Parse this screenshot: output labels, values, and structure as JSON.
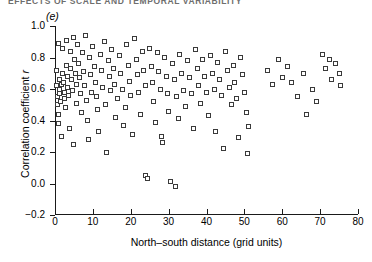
{
  "figure": {
    "running_head": "EFFECTS OF SCALE AND TEMPORAL VARIABILITY",
    "panel_label": "(e)"
  },
  "chart_data": {
    "type": "scatter",
    "title": "",
    "subtitle": "",
    "panel": "(e)",
    "xlabel": "North–south distance (grid units)",
    "ylabel": "Correlation coefficient r",
    "xlim": [
      0,
      80
    ],
    "ylim": [
      -0.2,
      1.0
    ],
    "xticks": [
      0,
      10,
      20,
      30,
      40,
      50,
      60,
      70,
      80
    ],
    "xticklabels": [
      "0",
      "10",
      "20",
      "30",
      "40",
      "50",
      "60",
      "70",
      "80"
    ],
    "yticks": [
      -0.2,
      0.0,
      0.2,
      0.4,
      0.6,
      0.8,
      1.0
    ],
    "yticklabels": [
      "−0.2",
      "0.0",
      "0.2",
      "0.4",
      "0.6",
      "0.8",
      "1.0"
    ],
    "grid": false,
    "legend": null,
    "marker": "open-square",
    "marker_color": "#3a3a3a",
    "marker_fill": "#ffffff",
    "points": [
      [
        0.4,
        0.72
      ],
      [
        0.5,
        0.62
      ],
      [
        0.6,
        0.55
      ],
      [
        0.7,
        0.5
      ],
      [
        0.8,
        0.44
      ],
      [
        0.9,
        0.38
      ],
      [
        1.0,
        0.89
      ],
      [
        1.1,
        0.66
      ],
      [
        1.2,
        0.6
      ],
      [
        1.3,
        0.57
      ],
      [
        1.5,
        0.52
      ],
      [
        1.6,
        0.63
      ],
      [
        1.8,
        0.3
      ],
      [
        2.0,
        0.86
      ],
      [
        2.1,
        0.7
      ],
      [
        2.3,
        0.64
      ],
      [
        2.5,
        0.58
      ],
      [
        2.6,
        0.54
      ],
      [
        2.8,
        0.48
      ],
      [
        3.0,
        0.91
      ],
      [
        3.1,
        0.75
      ],
      [
        3.3,
        0.68
      ],
      [
        3.4,
        0.61
      ],
      [
        3.6,
        0.56
      ],
      [
        3.8,
        0.35
      ],
      [
        4.0,
        0.84
      ],
      [
        4.2,
        0.73
      ],
      [
        4.4,
        0.66
      ],
      [
        4.6,
        0.59
      ],
      [
        4.8,
        0.25
      ],
      [
        5.0,
        0.93
      ],
      [
        5.2,
        0.79
      ],
      [
        5.4,
        0.7
      ],
      [
        5.6,
        0.63
      ],
      [
        5.8,
        0.51
      ],
      [
        6.0,
        0.88
      ],
      [
        6.3,
        0.76
      ],
      [
        6.5,
        0.67
      ],
      [
        6.8,
        0.57
      ],
      [
        7.0,
        0.45
      ],
      [
        7.2,
        0.83
      ],
      [
        7.5,
        0.71
      ],
      [
        7.8,
        0.62
      ],
      [
        8.0,
        0.94
      ],
      [
        8.2,
        0.53
      ],
      [
        8.5,
        0.4
      ],
      [
        8.8,
        0.28
      ],
      [
        9.0,
        0.8
      ],
      [
        9.3,
        0.69
      ],
      [
        9.6,
        0.58
      ],
      [
        10.0,
        0.87
      ],
      [
        10.3,
        0.74
      ],
      [
        10.6,
        0.64
      ],
      [
        11.0,
        0.55
      ],
      [
        11.3,
        0.47
      ],
      [
        11.6,
        0.33
      ],
      [
        12.0,
        0.82
      ],
      [
        12.3,
        0.72
      ],
      [
        12.6,
        0.61
      ],
      [
        13.0,
        0.9
      ],
      [
        13.3,
        0.5
      ],
      [
        13.6,
        0.2
      ],
      [
        14.0,
        0.78
      ],
      [
        14.3,
        0.68
      ],
      [
        14.6,
        0.59
      ],
      [
        15.0,
        0.85
      ],
      [
        15.4,
        0.73
      ],
      [
        15.8,
        0.63
      ],
      [
        16.0,
        0.42
      ],
      [
        16.5,
        0.54
      ],
      [
        17.0,
        0.81
      ],
      [
        17.4,
        0.7
      ],
      [
        17.8,
        0.6
      ],
      [
        18.0,
        0.37
      ],
      [
        18.5,
        0.48
      ],
      [
        19.0,
        0.88
      ],
      [
        19.4,
        0.75
      ],
      [
        19.8,
        0.65
      ],
      [
        20.0,
        0.56
      ],
      [
        20.5,
        0.31
      ],
      [
        21.0,
        0.92
      ],
      [
        21.4,
        0.79
      ],
      [
        21.8,
        0.69
      ],
      [
        22.0,
        0.58
      ],
      [
        22.5,
        0.44
      ],
      [
        23.0,
        0.84
      ],
      [
        23.4,
        0.72
      ],
      [
        23.8,
        0.62
      ],
      [
        24.0,
        0.05
      ],
      [
        24.3,
        0.03
      ],
      [
        25.0,
        0.86
      ],
      [
        25.4,
        0.74
      ],
      [
        25.8,
        0.64
      ],
      [
        26.0,
        0.52
      ],
      [
        26.5,
        0.39
      ],
      [
        27.0,
        0.83
      ],
      [
        27.4,
        0.71
      ],
      [
        27.8,
        0.6
      ],
      [
        28.0,
        0.3
      ],
      [
        28.3,
        0.26
      ],
      [
        29.0,
        0.8
      ],
      [
        29.4,
        0.68
      ],
      [
        29.8,
        0.57
      ],
      [
        30.0,
        0.46
      ],
      [
        30.6,
        0.01
      ],
      [
        31.0,
        0.76
      ],
      [
        31.5,
        0.66
      ],
      [
        31.8,
        -0.02
      ],
      [
        32.0,
        0.55
      ],
      [
        32.5,
        0.41
      ],
      [
        33.0,
        0.82
      ],
      [
        33.5,
        0.7
      ],
      [
        34.0,
        0.59
      ],
      [
        34.5,
        0.49
      ],
      [
        35.0,
        0.78
      ],
      [
        35.5,
        0.67
      ],
      [
        36.0,
        0.57
      ],
      [
        36.5,
        0.35
      ],
      [
        37.0,
        0.85
      ],
      [
        37.5,
        0.73
      ],
      [
        38.0,
        0.62
      ],
      [
        38.5,
        0.51
      ],
      [
        39.0,
        0.79
      ],
      [
        39.5,
        0.68
      ],
      [
        40.0,
        0.58
      ],
      [
        40.5,
        0.43
      ],
      [
        41.0,
        0.81
      ],
      [
        41.5,
        0.7
      ],
      [
        42.0,
        0.6
      ],
      [
        42.5,
        0.33
      ],
      [
        43.0,
        0.77
      ],
      [
        43.5,
        0.66
      ],
      [
        44.0,
        0.56
      ],
      [
        44.5,
        0.22
      ],
      [
        45.0,
        0.84
      ],
      [
        45.5,
        0.72
      ],
      [
        46.0,
        0.61
      ],
      [
        46.5,
        0.5
      ],
      [
        47.0,
        0.75
      ],
      [
        47.5,
        0.64
      ],
      [
        48.0,
        0.54
      ],
      [
        48.5,
        0.29
      ],
      [
        49.0,
        0.8
      ],
      [
        49.5,
        0.69
      ],
      [
        50.0,
        0.58
      ],
      [
        50.5,
        0.45
      ],
      [
        50.8,
        0.19
      ],
      [
        51.0,
        0.36
      ],
      [
        56.0,
        0.72
      ],
      [
        57.5,
        0.63
      ],
      [
        59.0,
        0.79
      ],
      [
        60.0,
        0.67
      ],
      [
        61.5,
        0.74
      ],
      [
        62.5,
        0.64
      ],
      [
        64.0,
        0.55
      ],
      [
        65.5,
        0.7
      ],
      [
        66.5,
        0.44
      ],
      [
        68.0,
        0.6
      ],
      [
        69.0,
        0.52
      ],
      [
        70.5,
        0.82
      ],
      [
        71.5,
        0.73
      ],
      [
        72.5,
        0.79
      ],
      [
        73.0,
        0.66
      ],
      [
        74.0,
        0.76
      ],
      [
        75.0,
        0.7
      ],
      [
        75.5,
        0.62
      ]
    ]
  }
}
